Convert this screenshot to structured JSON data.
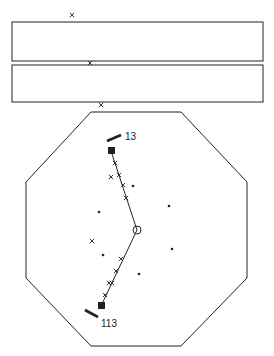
{
  "diagram": {
    "colors": {
      "ink": "#222222",
      "background": "#ffffff"
    },
    "top_marks": [
      {
        "x": 72,
        "y": 15,
        "glyph": "x"
      },
      {
        "x": 90,
        "y": 63,
        "glyph": "x"
      },
      {
        "x": 101,
        "y": 105,
        "glyph": "x"
      }
    ],
    "rectangles": [
      {
        "x": 12,
        "y": 22,
        "w": 251,
        "h": 39
      },
      {
        "x": 12,
        "y": 65,
        "w": 251,
        "h": 37
      }
    ],
    "octagon": {
      "points": "91,112 181,112 247,182 247,278 181,346 91,346 26,278 26,182"
    },
    "center_circle": {
      "cx": 137,
      "cy": 230,
      "r": 4
    },
    "path": {
      "points": "111,151 137,230 101,306"
    },
    "end_markers": [
      {
        "x": 108,
        "y": 147,
        "size": 7,
        "name": "top-end-square"
      },
      {
        "x": 98,
        "y": 302,
        "size": 7,
        "name": "bottom-end-square"
      }
    ],
    "bars": [
      {
        "x1": 107,
        "y1": 141,
        "x2": 121,
        "y2": 135,
        "label": "13",
        "lx": 125,
        "ly": 140
      },
      {
        "x1": 85,
        "y1": 310,
        "x2": 98,
        "y2": 317,
        "label": "113",
        "lx": 101,
        "ly": 327
      }
    ],
    "path_marks": [
      {
        "x": 115,
        "y": 163
      },
      {
        "x": 119,
        "y": 175
      },
      {
        "x": 123,
        "y": 185
      },
      {
        "x": 126,
        "y": 198
      },
      {
        "x": 121,
        "y": 259
      },
      {
        "x": 116,
        "y": 271
      },
      {
        "x": 109,
        "y": 283
      },
      {
        "x": 112,
        "y": 283
      },
      {
        "x": 105,
        "y": 295
      }
    ],
    "scatter_x": [
      {
        "x": 111,
        "y": 177
      },
      {
        "x": 92,
        "y": 241
      }
    ],
    "dots": [
      {
        "x": 133,
        "y": 186
      },
      {
        "x": 169,
        "y": 206
      },
      {
        "x": 99,
        "y": 212
      },
      {
        "x": 103,
        "y": 255
      },
      {
        "x": 172,
        "y": 249
      },
      {
        "x": 139,
        "y": 274
      }
    ]
  }
}
